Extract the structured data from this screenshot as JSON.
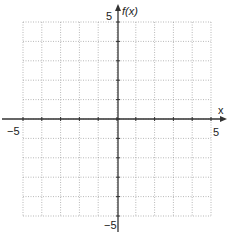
{
  "chart_data": {
    "type": "line",
    "title": "",
    "xlabel": "x",
    "ylabel": "f(x)",
    "xlim": [
      -5,
      5
    ],
    "ylim": [
      -5,
      5
    ],
    "x_tick_labels": [
      "-5",
      "5"
    ],
    "y_tick_labels": [
      "5",
      "-5"
    ],
    "grid": true,
    "grid_style": "dotted",
    "grid_step": 1,
    "series": [],
    "legend": null
  },
  "labels": {
    "x_axis": "x",
    "y_axis": "f(x)",
    "x_min": "−5",
    "x_max": "5",
    "y_max": "5",
    "y_min": "−5"
  },
  "colors": {
    "axis": "#333333",
    "grid": "#888888",
    "text": "#222222"
  }
}
